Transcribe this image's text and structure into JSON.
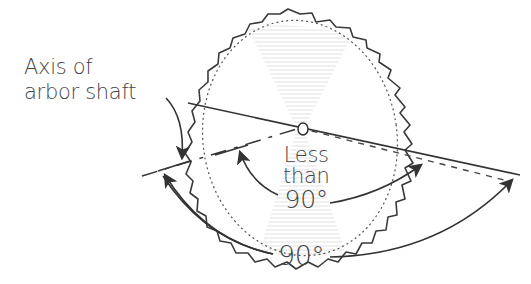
{
  "diagram": {
    "labels": {
      "axis_line1": "Axis of",
      "axis_line2": "arbor shaft",
      "less_line1": "Less",
      "less_line2": "than",
      "less_line3": "90°",
      "ninety": "90°"
    },
    "elements": [
      {
        "name": "saw-blade",
        "desc": "Toothed circular saw blade drawn in perspective"
      },
      {
        "name": "blade-face-line",
        "desc": "Solid line through blade center"
      },
      {
        "name": "arbor-axis-line",
        "desc": "Dashed line representing axis of arbor shaft"
      },
      {
        "name": "reference-dashed-line",
        "desc": "Dashed line from blade center to the right"
      },
      {
        "name": "less-than-90-arc",
        "desc": "Curved double arrow indicating angle less than 90°"
      },
      {
        "name": "ninety-arc",
        "desc": "Curved double arrow indicating 90° angle"
      },
      {
        "name": "axis-pointer-arrow",
        "desc": "Curved arrow from label to arbor axis"
      }
    ],
    "colors": {
      "ink": "#333333",
      "shading": "#c8c8c8",
      "background": "#ffffff"
    }
  }
}
